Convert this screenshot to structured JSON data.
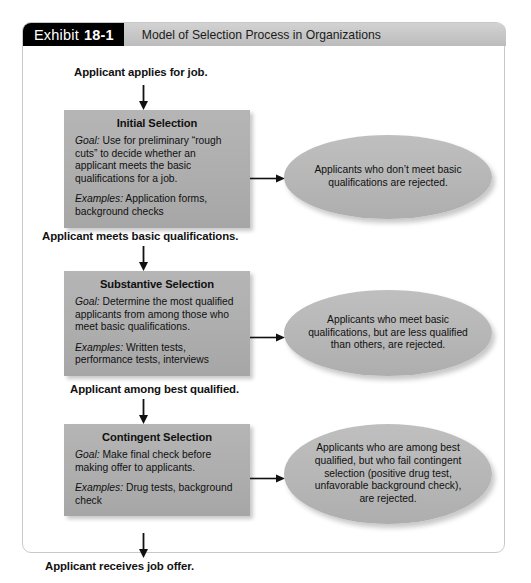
{
  "header": {
    "tag_word": "Exhibit",
    "tag_number": "18-1",
    "title": "Model of Selection Process in Organizations"
  },
  "diagram": {
    "type": "flowchart",
    "entry_label": "Applicant applies for job.",
    "exit_label": "Applicant receives job offer.",
    "stages": [
      {
        "title": "Initial Selection",
        "goal_lead": "Goal:",
        "goal_text": " Use for preliminary “rough cuts” to decide whether an applicant meets the basic qualifications for a job.",
        "examples_lead": "Examples:",
        "examples_text": " Application forms, background checks",
        "outcome": "Applicants who don’t meet basic qualifications are rejected.",
        "pass_label": "Applicant meets basic qualifications."
      },
      {
        "title": "Substantive Selection",
        "goal_lead": "Goal:",
        "goal_text": " Determine the most qualified applicants from among those who meet basic qualifications.",
        "examples_lead": "Examples:",
        "examples_text": " Written tests, performance tests, interviews",
        "outcome": "Applicants who meet basic qualifications, but are less qualified than others, are rejected.",
        "pass_label": "Applicant among best qualified."
      },
      {
        "title": "Contingent Selection",
        "goal_lead": "Goal:",
        "goal_text": " Make final check before making offer to applicants.",
        "examples_lead": "Examples:",
        "examples_text": " Drug tests, background check",
        "outcome": "Applicants who are among best qualified, but who fail contingent selection (positive drug test, unfavorable background check), are rejected.",
        "pass_label": ""
      }
    ]
  },
  "colors": {
    "tag_background": "#000000",
    "tag_text": "#ffffff",
    "title_bar": "#c6c6c6",
    "box_fill": "#adadad",
    "ellipse_fill": "#b6b6b6",
    "frame_border": "#c9c9c9",
    "text": "#101010"
  }
}
